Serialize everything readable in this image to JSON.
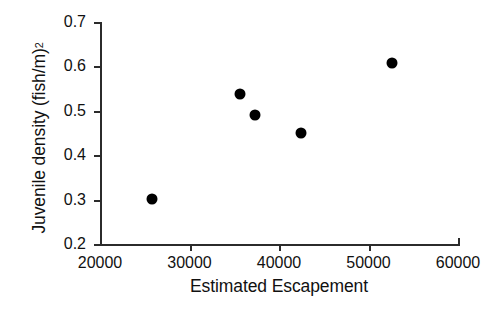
{
  "chart_data": {
    "type": "scatter",
    "title": "",
    "xlabel": "Estimated Escapement",
    "ylabel": "Juvenile density (fish/m)",
    "ylabel_superscript": "2",
    "xlim": [
      20000,
      60000
    ],
    "ylim": [
      0.2,
      0.7
    ],
    "xticks": [
      20000,
      30000,
      40000,
      50000,
      60000
    ],
    "yticks": [
      0.2,
      0.3,
      0.4,
      0.5,
      0.6,
      0.7
    ],
    "xtick_labels": [
      "20000",
      "30000",
      "40000",
      "50000",
      "60000"
    ],
    "ytick_labels": [
      "0.2",
      "0.3",
      "0.4",
      "0.5",
      "0.6",
      "0.7"
    ],
    "grid": false,
    "legend": false,
    "marker_color": "#000000",
    "marker_shape": "circle",
    "axis_color": "#2b2b2b",
    "background": "#ffffff",
    "points": [
      {
        "x": 25800,
        "y": 0.301
      },
      {
        "x": 35600,
        "y": 0.538
      },
      {
        "x": 37300,
        "y": 0.49
      },
      {
        "x": 42500,
        "y": 0.45
      },
      {
        "x": 52600,
        "y": 0.608
      }
    ]
  }
}
